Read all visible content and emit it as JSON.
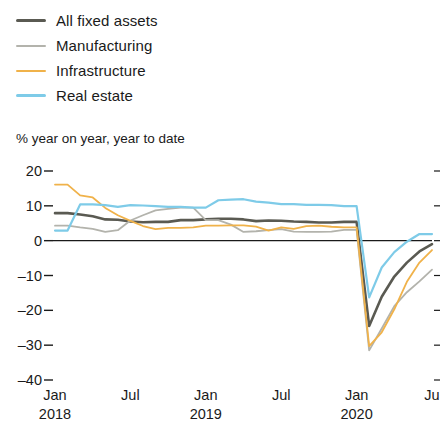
{
  "legend": {
    "items": [
      {
        "label": "All fixed assets",
        "color": "#5a5a52",
        "weight": "thick"
      },
      {
        "label": "Manufacturing",
        "color": "#b3b3ac",
        "weight": "thin"
      },
      {
        "label": "Infrastructure",
        "color": "#f0b24a",
        "weight": "thin"
      },
      {
        "label": "Real estate",
        "color": "#7ecbe8",
        "weight": "thin"
      }
    ]
  },
  "chart_data": {
    "type": "line",
    "title": "",
    "subtitle": "",
    "ylabel": "% year on year, year to date",
    "xlabel": "",
    "ylim": [
      -40,
      20
    ],
    "yticks": [
      20,
      10,
      0,
      -10,
      -20,
      -30,
      -40
    ],
    "ytick_labels": [
      "20",
      "10",
      "0",
      "-10",
      "-20",
      "-30",
      "-40"
    ],
    "grid": false,
    "zero_line": true,
    "legend_position": "top-left",
    "xticks": [
      {
        "label": "Jan",
        "year": "2018",
        "index": 0
      },
      {
        "label": "Jul",
        "year": "",
        "index": 6
      },
      {
        "label": "Jan",
        "year": "2019",
        "index": 12
      },
      {
        "label": "Jul",
        "year": "",
        "index": 18
      },
      {
        "label": "Jan",
        "year": "2020",
        "index": 24
      },
      {
        "label": "Ju",
        "year": "",
        "index": 30
      }
    ],
    "x": [
      0,
      1,
      2,
      3,
      4,
      5,
      6,
      7,
      8,
      9,
      10,
      11,
      12,
      13,
      14,
      15,
      16,
      17,
      18,
      19,
      20,
      21,
      22,
      23,
      24,
      25,
      26,
      27,
      28,
      29,
      30
    ],
    "series": [
      {
        "name": "All fixed assets",
        "color": "#5a5a52",
        "width": 2.6,
        "values": [
          7.9,
          7.9,
          7.5,
          7.0,
          6.1,
          6.0,
          5.5,
          5.3,
          5.4,
          5.4,
          5.9,
          5.9,
          6.1,
          6.3,
          6.3,
          6.1,
          5.6,
          5.8,
          5.7,
          5.5,
          5.4,
          5.2,
          5.2,
          5.4,
          5.4,
          -24.5,
          -16.1,
          -10.3,
          -6.3,
          -3.1,
          -1.0
        ]
      },
      {
        "name": "Manufacturing",
        "color": "#b3b3ac",
        "width": 1.8,
        "values": [
          4.3,
          4.3,
          3.8,
          3.4,
          2.5,
          3.0,
          5.8,
          7.3,
          8.7,
          9.1,
          9.5,
          9.5,
          5.9,
          5.9,
          4.6,
          2.5,
          2.7,
          3.0,
          3.3,
          2.6,
          2.5,
          2.5,
          2.6,
          3.1,
          3.1,
          -31.5,
          -25.2,
          -18.8,
          -14.8,
          -11.7,
          -8.3
        ]
      },
      {
        "name": "Infrastructure",
        "color": "#f0b24a",
        "width": 1.8,
        "values": [
          16.1,
          16.1,
          13.0,
          12.4,
          9.4,
          7.3,
          5.7,
          4.2,
          3.3,
          3.7,
          3.7,
          3.8,
          4.3,
          4.3,
          4.4,
          4.4,
          4.0,
          2.9,
          3.8,
          3.4,
          4.2,
          4.3,
          4.0,
          3.8,
          3.8,
          -30.3,
          -26.3,
          -19.7,
          -11.8,
          -6.3,
          -2.7
        ]
      },
      {
        "name": "Real estate",
        "color": "#7ecbe8",
        "width": 2.2,
        "values": [
          2.9,
          2.9,
          10.4,
          10.4,
          10.2,
          9.7,
          10.2,
          10.1,
          9.9,
          9.7,
          9.7,
          9.5,
          9.5,
          11.6,
          11.8,
          11.9,
          11.2,
          10.9,
          10.5,
          10.5,
          10.3,
          10.3,
          10.2,
          9.9,
          9.9,
          -16.3,
          -7.7,
          -3.3,
          -0.3,
          1.9,
          1.9
        ]
      }
    ]
  }
}
